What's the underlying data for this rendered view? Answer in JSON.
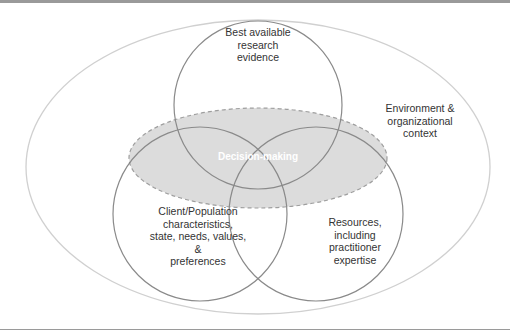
{
  "diagram": {
    "title": "",
    "colors": {
      "outer_ellipse_stroke": "#d0d0d0",
      "circle_stroke": "#8a8a8a",
      "decision_fill": "#dcdcdc",
      "decision_stroke": "#9e9e9e",
      "decision_text": "#ffffff",
      "text": "#333333",
      "frame": "#9a9a9a"
    },
    "outer": {
      "label_lines": [
        "Environment &",
        "organizational",
        "context"
      ]
    },
    "circles": [
      {
        "id": "research",
        "label_lines": [
          "Best available",
          "research",
          "evidence"
        ]
      },
      {
        "id": "client",
        "label_lines": [
          "Client/Population",
          "characteristics,",
          "state, needs, values,",
          "&",
          "preferences"
        ]
      },
      {
        "id": "resources",
        "label_lines": [
          "Resources,",
          "including",
          "practitioner",
          "expertise"
        ]
      }
    ],
    "center": {
      "label": "Decision-making"
    }
  }
}
